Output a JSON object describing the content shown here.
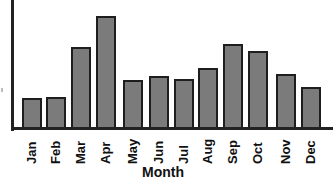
{
  "chart_data": {
    "type": "bar",
    "title": "",
    "xlabel": "Month",
    "ylabel": "",
    "categories": [
      "Jan",
      "Feb",
      "Mar",
      "Apr",
      "May",
      "Jun",
      "Jul",
      "Aug",
      "Sep",
      "Oct",
      "Nov",
      "Dec"
    ],
    "values": [
      30,
      31,
      81,
      112,
      48,
      52,
      49,
      60,
      84,
      77,
      54,
      41
    ],
    "ylim": [
      0,
      129
    ],
    "grid": false,
    "legend": null,
    "colors": {
      "bar_fill": "#7b7b7b",
      "bar_edge": "#1e1e1e",
      "axis": "#222222"
    }
  }
}
